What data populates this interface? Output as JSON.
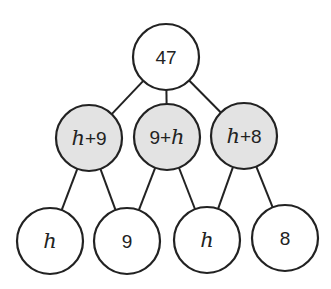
{
  "diagram": {
    "type": "tree",
    "colors": {
      "shaded": "#e3e3e3",
      "plain": "#ffffff",
      "stroke": "#222222"
    },
    "nodes": [
      {
        "id": "root",
        "parts": [
          {
            "t": "47",
            "v": false
          }
        ],
        "cx": 166,
        "cy": 57,
        "shaded": false
      },
      {
        "id": "m1",
        "parts": [
          {
            "t": "h",
            "v": true
          },
          {
            "t": "+9",
            "v": false
          }
        ],
        "cx": 89,
        "cy": 138,
        "shaded": true
      },
      {
        "id": "m2",
        "parts": [
          {
            "t": "9+",
            "v": false
          },
          {
            "t": "h",
            "v": true
          }
        ],
        "cx": 167,
        "cy": 137,
        "shaded": true
      },
      {
        "id": "m3",
        "parts": [
          {
            "t": "h",
            "v": true
          },
          {
            "t": "+8",
            "v": false
          }
        ],
        "cx": 244,
        "cy": 136,
        "shaded": true
      },
      {
        "id": "b1",
        "parts": [
          {
            "t": "h",
            "v": true
          }
        ],
        "cx": 50,
        "cy": 241,
        "shaded": false
      },
      {
        "id": "b2",
        "parts": [
          {
            "t": "9",
            "v": false
          }
        ],
        "cx": 127,
        "cy": 241,
        "shaded": false
      },
      {
        "id": "b3",
        "parts": [
          {
            "t": "h",
            "v": true
          }
        ],
        "cx": 207,
        "cy": 240,
        "shaded": false
      },
      {
        "id": "b4",
        "parts": [
          {
            "t": "8",
            "v": false
          }
        ],
        "cx": 285,
        "cy": 238,
        "shaded": false
      }
    ],
    "radius": 33,
    "edges": [
      [
        "root",
        "m1"
      ],
      [
        "root",
        "m2"
      ],
      [
        "root",
        "m3"
      ],
      [
        "m1",
        "b1"
      ],
      [
        "m1",
        "b2"
      ],
      [
        "m2",
        "b2"
      ],
      [
        "m2",
        "b3"
      ],
      [
        "m3",
        "b3"
      ],
      [
        "m3",
        "b4"
      ]
    ]
  }
}
